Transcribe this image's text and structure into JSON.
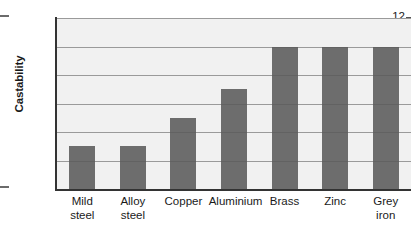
{
  "chart_data": {
    "type": "bar",
    "title": "",
    "xlabel": "",
    "ylabel": "Castability",
    "categories": [
      "Mild steel",
      "Alloy steel",
      "Copper",
      "Aluminium",
      "Brass",
      "Zinc",
      "Grey iron"
    ],
    "category_labels": [
      "Mild\nsteel",
      "Alloy\nsteel",
      "Copper",
      "Aluminium",
      "Brass",
      "Zinc",
      "Grey\niron"
    ],
    "values": [
      3,
      3,
      5,
      7,
      10,
      10,
      10
    ],
    "ylim": [
      0,
      12
    ],
    "yticks": [
      0,
      2,
      4,
      6,
      8,
      10,
      12
    ],
    "ytick_labels": [
      "0",
      "2",
      "4",
      "6",
      "8",
      "10",
      "12"
    ],
    "grid": true,
    "legend": null,
    "bar_color": "#5a5a5a",
    "plot_background": "#f1f1f1",
    "gridline_color": "#9a9a9a",
    "axis_color": "#333333"
  }
}
